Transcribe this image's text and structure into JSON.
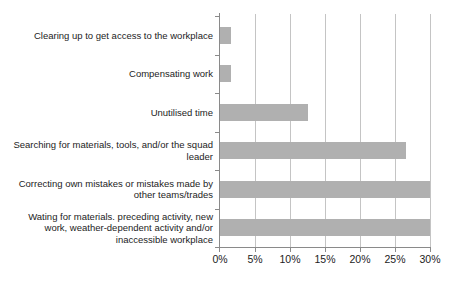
{
  "chart_data": {
    "type": "bar",
    "orientation": "horizontal",
    "title": "",
    "xlabel": "",
    "ylabel": "",
    "categories": [
      "Clearing up to get access to the workplace",
      "Compensating work",
      "Unutilised time",
      "Searching for materials, tools, and/or the squad leader",
      "Correcting own mistakes or mistakes made by other teams/trades",
      "Wating for materials. preceding activity, new work, weather-dependent activity and/or inaccessible workplace"
    ],
    "values": [
      1.5,
      1.5,
      12.5,
      26.5,
      30,
      30
    ],
    "unit": "%",
    "xlim": [
      0,
      30
    ],
    "x_tick_values": [
      0,
      5,
      10,
      15,
      20,
      25,
      30
    ],
    "x_tick_labels": [
      "0%",
      "5%",
      "10%",
      "15%",
      "20%",
      "25%",
      "30%"
    ],
    "grid": "vertical-only",
    "legend": "none",
    "colors": {
      "bar": "#b0b0b0",
      "gridline": "#c4c4c4",
      "axis": "#8a8a8a",
      "text": "#1c1c1c",
      "background": "#ffffff"
    }
  }
}
